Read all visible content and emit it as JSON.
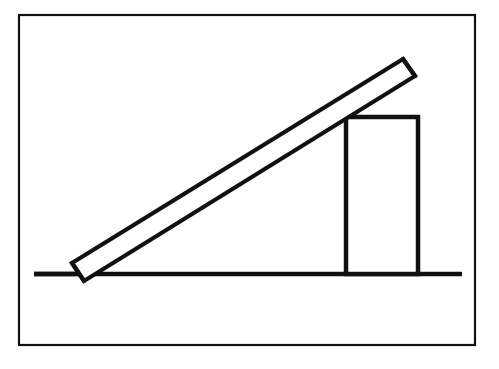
{
  "figure": {
    "canvas": {
      "width": 499,
      "height": 369
    },
    "background_color": "#ffffff",
    "ink_color": "#111111",
    "style": "black-and-white line drawing"
  },
  "elements": {
    "frame": {
      "name": "outer frame border",
      "x": 19,
      "y": 15,
      "width": 456,
      "height": 330,
      "stroke_width": 2.2,
      "color": "#111111"
    },
    "ground_line": {
      "name": "ground surface line",
      "x1": 34,
      "y1": 274,
      "x2": 462,
      "y2": 274,
      "stroke_width": 4.5,
      "color": "#111111"
    },
    "block": {
      "name": "rectangular block",
      "x": 346,
      "y": 117,
      "width": 72,
      "height": 157,
      "stroke_width": 4.5,
      "fill": "#ffffff",
      "color": "#111111",
      "top_left_corner": {
        "x": 346,
        "y": 117
      },
      "top_right_corner": {
        "x": 418,
        "y": 117
      },
      "sits_on": "ground_line"
    },
    "plank": {
      "name": "leaning plank",
      "description": "long thin rigid bar leaning from the ground over the block's top-left corner",
      "bottom_end": {
        "x": 78,
        "y": 272
      },
      "top_end": {
        "x": 409,
        "y": 68
      },
      "thickness": 11,
      "stroke_width": 4.2,
      "fill": "#ffffff",
      "color": "#111111",
      "angle_degrees": 31.6,
      "contact_point": {
        "x": 346,
        "y": 117,
        "label": "block top-left corner"
      },
      "outline_points": "72,263 403,59 415,76 84,281"
    }
  },
  "chart_data": {
    "type": "diagram",
    "shapes": [
      {
        "kind": "rectangle",
        "role": "frame",
        "x": 19,
        "y": 15,
        "w": 456,
        "h": 330
      },
      {
        "kind": "line",
        "role": "ground",
        "x1": 34,
        "y1": 274,
        "x2": 462,
        "y2": 274
      },
      {
        "kind": "rectangle",
        "role": "block",
        "x": 346,
        "y": 117,
        "w": 72,
        "h": 157
      },
      {
        "kind": "quadrilateral",
        "role": "plank",
        "points": "72,263 403,59 415,76 84,281"
      }
    ]
  }
}
